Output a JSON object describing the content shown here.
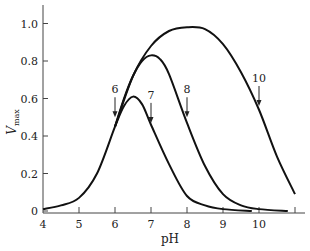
{
  "chart_data": {
    "type": "line",
    "title": "",
    "xlabel": "pH",
    "ylabel": "V",
    "ylabel_subscript": "max",
    "xlim": [
      4,
      11
    ],
    "ylim": [
      0,
      1.1
    ],
    "x_ticks": [
      4,
      5,
      6,
      7,
      8,
      9,
      10,
      11
    ],
    "x_tick_labels": [
      "4",
      "5",
      "6",
      "7",
      "8",
      "9",
      "10",
      ""
    ],
    "y_ticks": [
      0,
      0.2,
      0.4,
      0.6,
      0.8,
      1.0
    ],
    "y_tick_labels": [
      "0",
      "0.2",
      "0.4",
      "0.6",
      "0.8",
      "1.0"
    ],
    "grid": false,
    "legend": null,
    "series": [
      {
        "name": "curve-pKa-6-7",
        "x": [
          4,
          4.5,
          5,
          5.5,
          6,
          6.25,
          6.5,
          6.75,
          7,
          7.5,
          8,
          8.5,
          9,
          9.8
        ],
        "values": [
          0.01,
          0.03,
          0.07,
          0.2,
          0.45,
          0.56,
          0.61,
          0.57,
          0.46,
          0.25,
          0.08,
          0.03,
          0.01,
          0.0
        ]
      },
      {
        "name": "curve-pKa-6-8",
        "x": [
          6,
          6.25,
          6.5,
          6.75,
          7,
          7.25,
          7.5,
          8,
          8.5,
          9,
          9.5,
          10,
          10.8
        ],
        "values": [
          0.45,
          0.6,
          0.72,
          0.8,
          0.83,
          0.81,
          0.73,
          0.47,
          0.24,
          0.09,
          0.03,
          0.01,
          0.0
        ]
      },
      {
        "name": "curve-pKa-6-10",
        "x": [
          6,
          6.5,
          7,
          7.5,
          8,
          8.5,
          9,
          9.5,
          10,
          10.5,
          11
        ],
        "values": [
          0.45,
          0.72,
          0.88,
          0.96,
          0.98,
          0.97,
          0.89,
          0.74,
          0.54,
          0.29,
          0.09
        ]
      }
    ],
    "annotations": [
      {
        "text": "6",
        "x": 6,
        "arrow_to_y": 0.5
      },
      {
        "text": "7",
        "x": 7,
        "arrow_to_y": 0.47
      },
      {
        "text": "8",
        "x": 8,
        "arrow_to_y": 0.5
      },
      {
        "text": "10",
        "x": 10,
        "arrow_to_y": 0.56
      }
    ]
  }
}
